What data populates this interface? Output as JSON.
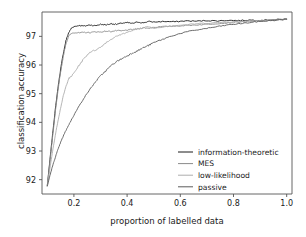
{
  "chart_data": {
    "type": "line",
    "title": "",
    "xlabel": "proportion of labelled data",
    "ylabel": "classification accuracy",
    "xlim": [
      0.08,
      1.02
    ],
    "ylim": [
      91.5,
      97.85
    ],
    "xticks": [
      "0.2",
      "0.4",
      "0.6",
      "0.8",
      "1.0"
    ],
    "xtick_values": [
      0.2,
      0.4,
      0.6,
      0.8,
      1.0
    ],
    "yticks": [
      "92",
      "93",
      "94",
      "95",
      "96",
      "97"
    ],
    "ytick_values": [
      92,
      93,
      94,
      95,
      96,
      97
    ],
    "grid": false,
    "legend_position": "lower right",
    "series": [
      {
        "name": "information-theoretic",
        "color": "#1a1a1a",
        "x": [
          0.1,
          0.11,
          0.12,
          0.13,
          0.14,
          0.15,
          0.16,
          0.17,
          0.18,
          0.19,
          0.2,
          0.22,
          0.24,
          0.26,
          0.28,
          0.3,
          0.32,
          0.34,
          0.36,
          0.38,
          0.4,
          0.42,
          0.44,
          0.46,
          0.48,
          0.5,
          0.54,
          0.58,
          0.62,
          0.66,
          0.7,
          0.74,
          0.78,
          0.82,
          0.86,
          0.9,
          0.94,
          0.98,
          1.0
        ],
        "y": [
          91.8,
          92.7,
          93.6,
          94.45,
          95.2,
          95.85,
          96.4,
          96.85,
          97.12,
          97.28,
          97.34,
          97.38,
          97.36,
          97.4,
          97.37,
          97.42,
          97.4,
          97.44,
          97.42,
          97.46,
          97.48,
          97.45,
          97.5,
          97.47,
          97.52,
          97.5,
          97.52,
          97.51,
          97.54,
          97.53,
          97.55,
          97.54,
          97.56,
          97.55,
          97.57,
          97.56,
          97.58,
          97.59,
          97.6
        ]
      },
      {
        "name": "MES",
        "color": "#8a8a8a",
        "x": [
          0.1,
          0.11,
          0.12,
          0.13,
          0.14,
          0.15,
          0.16,
          0.17,
          0.18,
          0.19,
          0.2,
          0.22,
          0.24,
          0.26,
          0.28,
          0.3,
          0.32,
          0.34,
          0.36,
          0.38,
          0.4,
          0.42,
          0.44,
          0.46,
          0.48,
          0.5,
          0.54,
          0.58,
          0.62,
          0.66,
          0.7,
          0.74,
          0.78,
          0.82,
          0.86,
          0.9,
          0.94,
          0.98,
          1.0
        ],
        "y": [
          91.8,
          92.65,
          93.5,
          94.35,
          95.1,
          95.75,
          96.3,
          96.75,
          97.0,
          97.1,
          97.13,
          97.12,
          97.14,
          97.13,
          97.16,
          97.15,
          97.18,
          97.17,
          97.2,
          97.19,
          97.22,
          97.24,
          97.26,
          97.3,
          97.28,
          97.32,
          97.34,
          97.36,
          97.38,
          97.4,
          97.42,
          97.45,
          97.47,
          97.5,
          97.52,
          97.54,
          97.56,
          97.58,
          97.6
        ]
      },
      {
        "name": "low-likelihood",
        "color": "#adadad",
        "x": [
          0.1,
          0.11,
          0.12,
          0.13,
          0.14,
          0.15,
          0.16,
          0.17,
          0.18,
          0.19,
          0.2,
          0.22,
          0.24,
          0.26,
          0.28,
          0.3,
          0.32,
          0.34,
          0.36,
          0.38,
          0.4,
          0.42,
          0.44,
          0.46,
          0.48,
          0.5,
          0.54,
          0.58,
          0.62,
          0.66,
          0.7,
          0.74,
          0.78,
          0.82,
          0.86,
          0.9,
          0.94,
          0.98,
          1.0
        ],
        "y": [
          91.78,
          92.4,
          93.0,
          93.55,
          94.05,
          94.5,
          94.92,
          95.25,
          95.52,
          95.6,
          95.72,
          96.0,
          96.25,
          96.45,
          96.52,
          96.62,
          96.78,
          96.9,
          97.0,
          97.08,
          97.14,
          97.2,
          97.26,
          97.3,
          97.34,
          97.28,
          97.34,
          97.38,
          97.4,
          97.44,
          97.46,
          97.48,
          97.5,
          97.52,
          97.54,
          97.55,
          97.57,
          97.58,
          97.6
        ]
      },
      {
        "name": "passive",
        "color": "#5c5c5c",
        "x": [
          0.1,
          0.11,
          0.12,
          0.13,
          0.14,
          0.15,
          0.16,
          0.17,
          0.18,
          0.19,
          0.2,
          0.22,
          0.24,
          0.26,
          0.28,
          0.3,
          0.32,
          0.34,
          0.36,
          0.38,
          0.4,
          0.42,
          0.44,
          0.46,
          0.48,
          0.5,
          0.54,
          0.58,
          0.62,
          0.66,
          0.7,
          0.74,
          0.78,
          0.82,
          0.86,
          0.9,
          0.94,
          0.98,
          1.0
        ],
        "y": [
          91.78,
          92.15,
          92.48,
          92.78,
          93.05,
          93.3,
          93.52,
          93.72,
          93.9,
          94.08,
          94.25,
          94.58,
          94.88,
          95.15,
          95.4,
          95.62,
          95.8,
          95.98,
          96.12,
          96.22,
          96.32,
          96.42,
          96.5,
          96.6,
          96.68,
          96.78,
          96.92,
          97.05,
          97.15,
          97.22,
          97.28,
          97.34,
          97.4,
          97.44,
          97.48,
          97.52,
          97.55,
          97.58,
          97.6
        ]
      }
    ]
  },
  "legend": {
    "items": [
      {
        "label": "information-theoretic"
      },
      {
        "label": "MES"
      },
      {
        "label": "low-likelihood"
      },
      {
        "label": "passive"
      }
    ]
  },
  "axes": {
    "spine_color": "#555555"
  }
}
